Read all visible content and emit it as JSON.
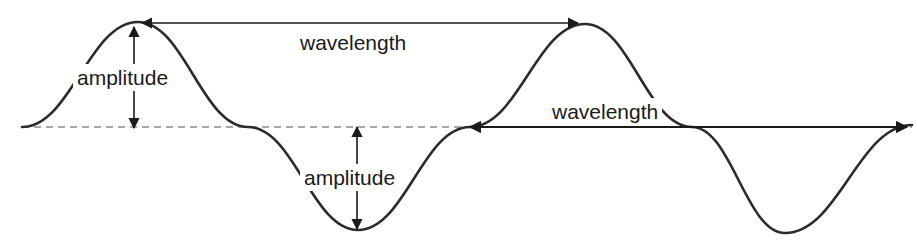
{
  "diagram": {
    "canvas": {
      "width": 917,
      "height": 247,
      "background": "#ffffff"
    },
    "colors": {
      "wave_stroke": "#2b2b2b",
      "baseline_stroke": "#a8a8a8",
      "arrow_stroke": "#1a1a1a",
      "text": "#1a1a1a"
    },
    "labels": {
      "wavelength_top": "wavelength",
      "wavelength_bottom": "wavelength",
      "amplitude_top": "amplitude",
      "amplitude_bottom": "amplitude"
    }
  },
  "chart_data": {
    "type": "line",
    "title": "",
    "xlabel": "",
    "ylabel": "",
    "grid": false,
    "legend": "none",
    "xlim": [
      22,
      912
    ],
    "ylim": [
      22,
      233
    ],
    "series": [
      {
        "name": "wave",
        "description": "sinusoid, two full cycles, equilibrium at y=127",
        "amplitude_px": 103,
        "wavelength_px": 446,
        "equilibrium_y_px": 127,
        "start_x_px": 22,
        "end_x_px": 912,
        "key_points": [
          {
            "label": "start-zero-crossing",
            "x": 22,
            "y": 127
          },
          {
            "label": "crest-1",
            "x": 138,
            "y": 22
          },
          {
            "label": "zero-crossing-descending-1",
            "x": 248,
            "y": 127
          },
          {
            "label": "trough-1",
            "x": 358,
            "y": 230
          },
          {
            "label": "zero-crossing-ascending-1",
            "x": 470,
            "y": 127
          },
          {
            "label": "crest-2",
            "x": 585,
            "y": 24
          },
          {
            "label": "zero-crossing-descending-2",
            "x": 692,
            "y": 127
          },
          {
            "label": "trough-2",
            "x": 785,
            "y": 233
          },
          {
            "label": "end",
            "x": 912,
            "y": 125
          }
        ]
      }
    ],
    "annotations": [
      {
        "name": "wavelength-top",
        "text": "wavelength",
        "type": "double-headed-horizontal-arrow",
        "from": {
          "x": 142,
          "y": 23
        },
        "to": {
          "x": 578,
          "y": 23
        },
        "measures": "crest-to-crest distance"
      },
      {
        "name": "wavelength-bottom",
        "text": "wavelength",
        "type": "double-headed-horizontal-arrow",
        "from": {
          "x": 470,
          "y": 127
        },
        "to": {
          "x": 907,
          "y": 127
        },
        "measures": "zero-crossing to zero-crossing distance"
      },
      {
        "name": "amplitude-top",
        "text": "amplitude",
        "type": "double-headed-vertical-arrow",
        "from": {
          "x": 134,
          "y": 27
        },
        "to": {
          "x": 134,
          "y": 128
        },
        "measures": "equilibrium to crest displacement"
      },
      {
        "name": "amplitude-bottom",
        "text": "amplitude",
        "type": "double-headed-vertical-arrow",
        "from": {
          "x": 357,
          "y": 127
        },
        "to": {
          "x": 357,
          "y": 229
        },
        "measures": "equilibrium to trough displacement"
      }
    ],
    "baseline": {
      "name": "equilibrium-line",
      "style": "dashed",
      "y": 127,
      "from_x": 22,
      "to_x": 912,
      "color": "#a8a8a8"
    }
  }
}
